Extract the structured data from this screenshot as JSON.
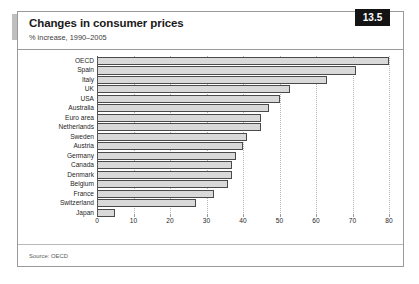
{
  "badge": {
    "label": "13.5"
  },
  "header": {
    "title": "Changes in consumer prices",
    "subtitle": "% increase, 1990–2005"
  },
  "footer": {
    "source": "Source: OECD"
  },
  "chart_data": {
    "type": "bar",
    "orientation": "horizontal",
    "title": "Changes in consumer prices",
    "subtitle": "% increase, 1990–2005",
    "xlabel": "",
    "ylabel": "",
    "xlim": [
      0,
      80
    ],
    "grid": true,
    "legend": null,
    "source": "Source: OECD",
    "xticks": [
      0,
      10,
      20,
      30,
      40,
      50,
      60,
      70,
      80
    ],
    "categories": [
      "OECD",
      "Spain",
      "Italy",
      "UK",
      "USA",
      "Australia",
      "Euro area",
      "Netherlands",
      "Sweden",
      "Austria",
      "Germany",
      "Canada",
      "Denmark",
      "Belgium",
      "France",
      "Switzerland",
      "Japan"
    ],
    "values": [
      80,
      71,
      63,
      53,
      50,
      47,
      45,
      45,
      41,
      40,
      38,
      37,
      37,
      36,
      32,
      27,
      5
    ],
    "series": [
      {
        "name": "% increase 1990–2005",
        "values": [
          80,
          71,
          63,
          53,
          50,
          47,
          45,
          45,
          41,
          40,
          38,
          37,
          37,
          36,
          32,
          27,
          5
        ]
      }
    ],
    "bar_color": "#d9d9d9",
    "bar_edge_color": "#4a4a4a"
  }
}
